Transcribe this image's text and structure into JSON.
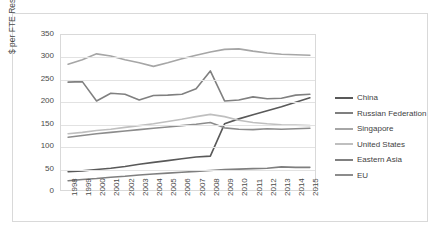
{
  "chart_data": {
    "type": "line",
    "title": "",
    "xlabel": "",
    "ylabel": "$ per FTE Researcher",
    "ylim": [
      0,
      350
    ],
    "ytick_labels": [
      "350",
      "300",
      "250",
      "200",
      "150",
      "100",
      "50",
      "0"
    ],
    "ytick_values": [
      350,
      300,
      250,
      200,
      150,
      100,
      50,
      0
    ],
    "grid": true,
    "legend_position": "right",
    "categories": [
      "1998",
      "1999",
      "2000",
      "2001",
      "2002",
      "2003",
      "2004",
      "2005",
      "2006",
      "2007",
      "2008",
      "2009",
      "2010",
      "2011",
      "2012",
      "2013",
      "2014",
      "2015"
    ],
    "series": [
      {
        "name": "China",
        "color": "#595959",
        "values": [
          45,
          47,
          50,
          53,
          57,
          62,
          66,
          70,
          74,
          78,
          80,
          152,
          163,
          172,
          181,
          190,
          200,
          210
        ]
      },
      {
        "name": "Russian Federation",
        "color": "#7f7f7f",
        "values": [
          25,
          28,
          30,
          33,
          35,
          38,
          40,
          42,
          44,
          46,
          48,
          50,
          51,
          52,
          53,
          56,
          55,
          55
        ]
      },
      {
        "name": "Singapore",
        "color": "#a6a6a6",
        "values": [
          285,
          295,
          308,
          303,
          295,
          288,
          280,
          288,
          297,
          305,
          312,
          318,
          319,
          314,
          310,
          307,
          306,
          305
        ]
      },
      {
        "name": "United States",
        "color": "#bfbfbf",
        "values": [
          130,
          133,
          137,
          140,
          144,
          148,
          152,
          157,
          162,
          168,
          173,
          168,
          160,
          155,
          152,
          150,
          149,
          148
        ]
      },
      {
        "name": "Eastern Asia",
        "color": "#808080",
        "values": [
          245,
          246,
          203,
          220,
          218,
          205,
          215,
          216,
          218,
          230,
          270,
          203,
          205,
          212,
          208,
          209,
          216,
          218
        ]
      },
      {
        "name": "EU",
        "color": "#8c8c8c",
        "values": [
          122,
          126,
          130,
          133,
          136,
          139,
          142,
          145,
          148,
          151,
          155,
          143,
          140,
          139,
          141,
          140,
          141,
          142
        ]
      }
    ]
  },
  "legend": {
    "items": [
      {
        "label": "China"
      },
      {
        "label": "Russian Federation"
      },
      {
        "label": "Singapore"
      },
      {
        "label": "United States"
      },
      {
        "label": "Eastern Asia"
      },
      {
        "label": "EU"
      }
    ]
  }
}
